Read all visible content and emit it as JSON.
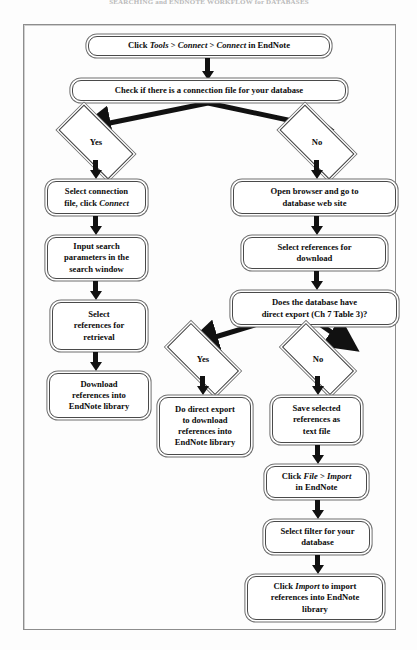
{
  "caption": "SEARCHING and ENDNOTE WORKFLOW for DATABASES",
  "diagram": {
    "type": "flowchart",
    "nodes": [
      {
        "id": "n1",
        "kind": "process",
        "text": "Click Tools > Connect > Connect in EndNote",
        "parts": [
          {
            "t": "Click ",
            "i": false
          },
          {
            "t": "Tools",
            "i": true
          },
          {
            "t": " > ",
            "i": false
          },
          {
            "t": "Connect",
            "i": true
          },
          {
            "t": " > ",
            "i": false
          },
          {
            "t": "Connect",
            "i": true
          },
          {
            "t": " in EndNote",
            "i": false
          }
        ]
      },
      {
        "id": "n2",
        "kind": "process",
        "text": "Check if there is a connection file for your database",
        "parts": [
          {
            "t": "Check if there is a connection file for your database",
            "i": false
          }
        ]
      },
      {
        "id": "d1",
        "kind": "decision",
        "text": "Yes"
      },
      {
        "id": "d2",
        "kind": "decision",
        "text": "No"
      },
      {
        "id": "n3",
        "kind": "process",
        "text": "Select connection file, click Connect",
        "parts": [
          {
            "t": "Select connection",
            "i": false
          },
          {
            "br": true
          },
          {
            "t": "file, click ",
            "i": false
          },
          {
            "t": "Connect",
            "i": true
          }
        ]
      },
      {
        "id": "n4",
        "kind": "process",
        "text": "Input search parameters in the search window",
        "parts": [
          {
            "t": "Input search",
            "i": false
          },
          {
            "br": true
          },
          {
            "t": "parameters in the",
            "i": false
          },
          {
            "br": true
          },
          {
            "t": "search window",
            "i": false
          }
        ]
      },
      {
        "id": "n5",
        "kind": "process",
        "text": "Select references for retrieval",
        "parts": [
          {
            "t": "Select",
            "i": false
          },
          {
            "br": true
          },
          {
            "t": "references for",
            "i": false
          },
          {
            "br": true
          },
          {
            "t": "retrieval",
            "i": false
          }
        ]
      },
      {
        "id": "n6",
        "kind": "process",
        "text": "Download references into EndNote library",
        "parts": [
          {
            "t": "Download",
            "i": false
          },
          {
            "br": true
          },
          {
            "t": "references into",
            "i": false
          },
          {
            "br": true
          },
          {
            "t": "EndNote library",
            "i": false
          }
        ]
      },
      {
        "id": "n7",
        "kind": "process",
        "text": "Open browser and go to database web site",
        "parts": [
          {
            "t": "Open browser and go to",
            "i": false
          },
          {
            "br": true
          },
          {
            "t": "database web site",
            "i": false
          }
        ]
      },
      {
        "id": "n8",
        "kind": "process",
        "text": "Select references for download",
        "parts": [
          {
            "t": "Select references for",
            "i": false
          },
          {
            "br": true
          },
          {
            "t": "download",
            "i": false
          }
        ]
      },
      {
        "id": "n9",
        "kind": "process",
        "text": "Does the database have direct export (Ch 7 Table 3)?",
        "parts": [
          {
            "t": "Does the database have",
            "i": false
          },
          {
            "br": true
          },
          {
            "t": "direct export (Ch 7 Table 3)?",
            "i": false
          }
        ]
      },
      {
        "id": "d3",
        "kind": "decision",
        "text": "Yes"
      },
      {
        "id": "d4",
        "kind": "decision",
        "text": "No"
      },
      {
        "id": "n10",
        "kind": "process",
        "text": "Do direct export to download references into EndNote library",
        "parts": [
          {
            "t": "Do direct export",
            "i": false
          },
          {
            "br": true
          },
          {
            "t": "to download",
            "i": false
          },
          {
            "br": true
          },
          {
            "t": "references into",
            "i": false
          },
          {
            "br": true
          },
          {
            "t": "EndNote library",
            "i": false
          }
        ]
      },
      {
        "id": "n11",
        "kind": "process",
        "text": "Save selected references as text file",
        "parts": [
          {
            "t": "Save selected",
            "i": false
          },
          {
            "br": true
          },
          {
            "t": "references as",
            "i": false
          },
          {
            "br": true
          },
          {
            "t": "text file",
            "i": false
          }
        ]
      },
      {
        "id": "n12",
        "kind": "process",
        "text": "Click File > Import in EndNote",
        "parts": [
          {
            "t": "Click ",
            "i": false
          },
          {
            "t": "File",
            "i": true
          },
          {
            "t": " > ",
            "i": false
          },
          {
            "t": "Import",
            "i": true
          },
          {
            "br": true
          },
          {
            "t": "in EndNote",
            "i": false
          }
        ]
      },
      {
        "id": "n13",
        "kind": "process",
        "text": "Select filter for your database",
        "parts": [
          {
            "t": "Select filter for your",
            "i": false
          },
          {
            "br": true
          },
          {
            "t": "database",
            "i": false
          }
        ]
      },
      {
        "id": "n14",
        "kind": "process",
        "text": "Click Import to import references into EndNote library",
        "parts": [
          {
            "t": "Click ",
            "i": false
          },
          {
            "t": "Import",
            "i": true
          },
          {
            "t": " to import",
            "i": false
          },
          {
            "br": true
          },
          {
            "t": "references into EndNote",
            "i": false
          },
          {
            "br": true
          },
          {
            "t": "library",
            "i": false
          }
        ]
      }
    ],
    "edges": [
      {
        "from": "n1",
        "to": "n2",
        "label": ""
      },
      {
        "from": "n2",
        "to": "d1",
        "label": ""
      },
      {
        "from": "n2",
        "to": "d2",
        "label": ""
      },
      {
        "from": "d1",
        "to": "n3",
        "label": "Yes"
      },
      {
        "from": "n3",
        "to": "n4",
        "label": ""
      },
      {
        "from": "n4",
        "to": "n5",
        "label": ""
      },
      {
        "from": "n5",
        "to": "n6",
        "label": ""
      },
      {
        "from": "d2",
        "to": "n7",
        "label": "No"
      },
      {
        "from": "n7",
        "to": "n8",
        "label": ""
      },
      {
        "from": "n8",
        "to": "n9",
        "label": ""
      },
      {
        "from": "n9",
        "to": "d3",
        "label": ""
      },
      {
        "from": "n9",
        "to": "d4",
        "label": ""
      },
      {
        "from": "d3",
        "to": "n10",
        "label": "Yes"
      },
      {
        "from": "d4",
        "to": "n11",
        "label": "No"
      },
      {
        "from": "n11",
        "to": "n12",
        "label": ""
      },
      {
        "from": "n12",
        "to": "n13",
        "label": ""
      },
      {
        "from": "n13",
        "to": "n14",
        "label": ""
      }
    ],
    "colors": {
      "line": "#111111",
      "node_border": "#4a4a4a",
      "node_fill": "#ffffff",
      "frame": "#8d8d8d"
    }
  }
}
